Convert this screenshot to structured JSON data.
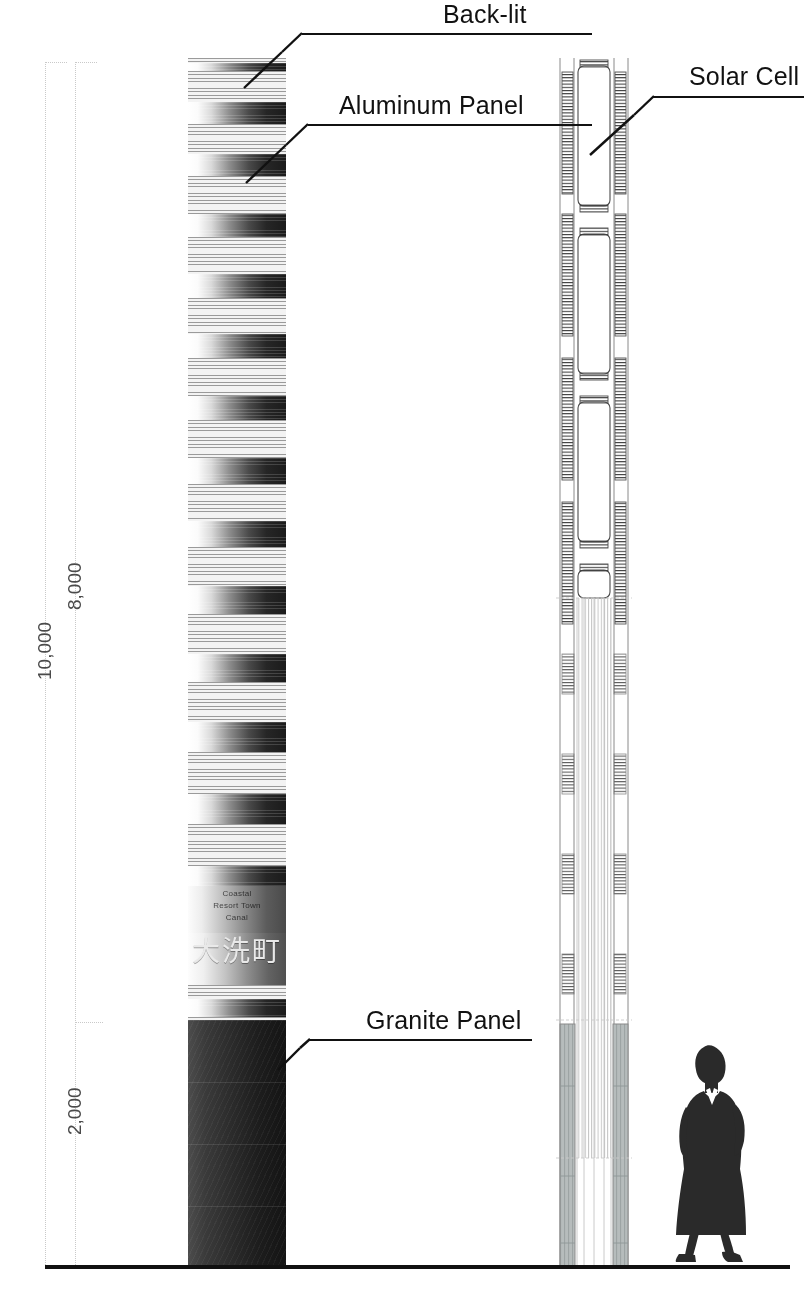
{
  "drawing": {
    "type": "architectural-elevation",
    "title": "Signage Tower Elevation and Section",
    "ground_line_label": "ground-line"
  },
  "callouts": [
    {
      "id": "back-lit",
      "label": "Back-lit"
    },
    {
      "id": "aluminum-panel",
      "label": "Aluminum Panel"
    },
    {
      "id": "solar-cell",
      "label": "Solar Cell"
    },
    {
      "id": "granite-panel",
      "label": "Granite Panel"
    }
  ],
  "dimensions": [
    {
      "id": "overall",
      "label": "10,000"
    },
    {
      "id": "upper",
      "label": "8,000"
    },
    {
      "id": "base",
      "label": "2,000"
    }
  ],
  "signage": {
    "latin_lines": [
      "Coastal",
      "Resort Town",
      "Canal"
    ],
    "cjk_text": "大洗町"
  },
  "colors": {
    "ink": "#111111",
    "dimension_gray": "#c9c9c9",
    "dimension_text": "#4a4a4a",
    "granite_dark": "#1d1d1d",
    "panel_light": "#f3f3f3",
    "hatch_gray": "#9a9a9a",
    "section_line": "#6e6e6e"
  },
  "scale_figure": {
    "name": "human-scale-figure",
    "description": "standing woman silhouette"
  }
}
